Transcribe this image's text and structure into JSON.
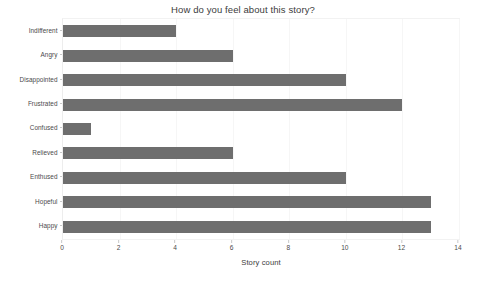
{
  "chart_data": {
    "type": "bar",
    "orientation": "horizontal",
    "title": "How do you feel about this story?",
    "xlabel": "Story count",
    "ylabel": "",
    "categories": [
      "Indifferent",
      "Angry",
      "Disappointed",
      "Frustrated",
      "Confused",
      "Relieved",
      "Enthused",
      "Hopeful",
      "Happy"
    ],
    "values": [
      4,
      6,
      10,
      12,
      1,
      6,
      10,
      13,
      13
    ],
    "xlim": [
      0,
      14
    ],
    "xticks": [
      0,
      2,
      4,
      6,
      8,
      10,
      12,
      14
    ],
    "xtick_labels": [
      "0",
      "2",
      "4",
      "6",
      "8",
      "10",
      "12",
      "14"
    ],
    "grid": true,
    "grid_axis": "x",
    "legend": false,
    "bar_color": "#6e6e6e",
    "background_color": "#ffffff",
    "gridline_color": "#f6f6f6",
    "axis_color": "#c8c8c8",
    "text_color": "#4a4a4a"
  }
}
